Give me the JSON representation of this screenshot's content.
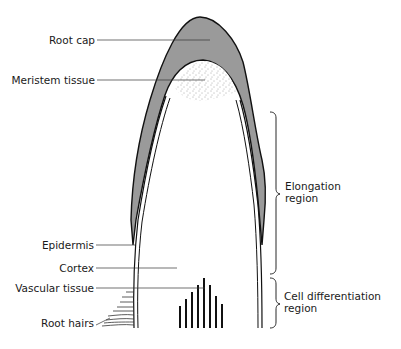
{
  "diagram": {
    "colors": {
      "root_cap_fill": "#9a9a9a",
      "outline": "#111111",
      "background": "#ffffff",
      "text": "#1a1a1a"
    },
    "labels_left": [
      {
        "id": "root-cap",
        "text": "Root cap"
      },
      {
        "id": "meristem-tissue",
        "text": "Meristem tissue"
      },
      {
        "id": "epidermis",
        "text": "Epidermis"
      },
      {
        "id": "cortex",
        "text": "Cortex"
      },
      {
        "id": "vascular-tissue",
        "text": "Vascular tissue"
      },
      {
        "id": "root-hairs",
        "text": "Root hairs"
      }
    ],
    "regions_right": [
      {
        "id": "elongation-region",
        "line1": "Elongation",
        "line2": "region"
      },
      {
        "id": "cell-differentiation-region",
        "line1": "Cell differentiation",
        "line2": "region"
      }
    ]
  }
}
